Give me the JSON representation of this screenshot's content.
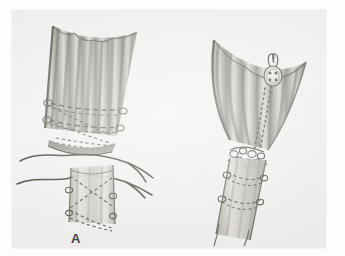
{
  "figure": {
    "medium": "halftone pen-and-wash scanned plate",
    "background_color": "#f1f0ee",
    "ink_color": "#4a4844",
    "panel_count": 2
  },
  "panels": [
    {
      "id": "A",
      "label": "A",
      "caption": "Flared proximal segment with interrupted sutures placed, long untied suture ends crossing between the two divided tube segments",
      "elements": [
        {
          "name": "flared-proximal-segment",
          "description": "wide fluted tube mouth with vertical striations"
        },
        {
          "name": "suture-loop-row-upper",
          "description": "row of suture loops encircling the segment"
        },
        {
          "name": "suture-loop-row-lower",
          "description": "second row of suture loops below the first"
        },
        {
          "name": "dashed-suture-lines",
          "description": "dashed internal suture tracks"
        },
        {
          "name": "free-suture-ends",
          "description": "long untied thread tails extending left and right"
        },
        {
          "name": "distal-tube-segment",
          "description": "lower narrow tube with crossed dashed sutures"
        }
      ]
    },
    {
      "id": "B",
      "label": "B",
      "caption": "Completed anastomosis: segment telescoped and secured, suture carried up the wall and tied over an external button bolster",
      "elements": [
        {
          "name": "flared-proximal-segment",
          "description": "wide fluted tube mouth with vertical striations"
        },
        {
          "name": "button-bolster",
          "description": "four-hole button used as external suture anchor"
        },
        {
          "name": "suture-track-dashed",
          "description": "dotted suture line running from button down the wall"
        },
        {
          "name": "anastomosis-knot-cluster",
          "description": "cluster of tied knots at the junction"
        },
        {
          "name": "encircling-suture-rows",
          "description": "two encircling rows of sutures on the distal tube"
        },
        {
          "name": "distal-tube-segment",
          "description": "narrow distal tube continuing downward"
        }
      ]
    }
  ],
  "colors": {
    "paper": "#f1f0ee",
    "page": "#fdfdfd",
    "ink_dark": "#4a4844",
    "ink_mid": "#6f6d68",
    "ink_light": "#9c9a94",
    "wash_light": "#d9d7d2",
    "wash_mid": "#b6b3ac",
    "wash_dark": "#8d8a83",
    "label": "#3a3a3a"
  }
}
